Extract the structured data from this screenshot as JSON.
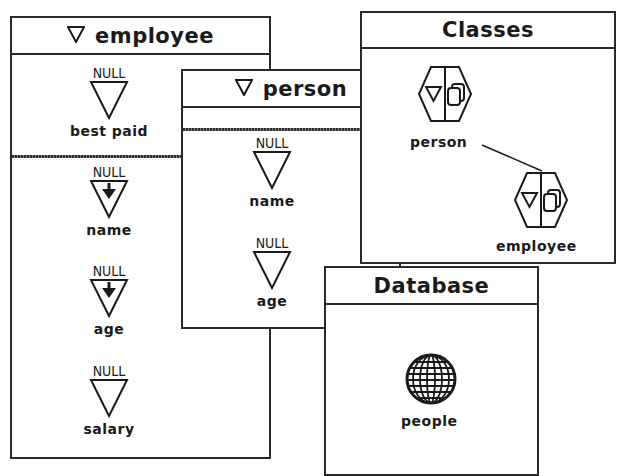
{
  "windows": {
    "employee": {
      "title": "employee",
      "top_slots": [
        {
          "value": "NULL",
          "label": "best paid",
          "inherited": false
        }
      ],
      "slots": [
        {
          "value": "NULL",
          "label": "name",
          "inherited": true
        },
        {
          "value": "NULL",
          "label": "age",
          "inherited": true
        },
        {
          "value": "NULL",
          "label": "salary",
          "inherited": false
        }
      ]
    },
    "person": {
      "title": "person",
      "slots": [
        {
          "value": "NULL",
          "label": "name"
        },
        {
          "value": "NULL",
          "label": "age"
        }
      ]
    },
    "classes": {
      "title": "Classes",
      "items": [
        {
          "label": "person",
          "icon": "class-hexagon-icon"
        },
        {
          "label": "employee",
          "icon": "class-hexagon-icon"
        }
      ],
      "link": {
        "from": "person",
        "to": "employee"
      }
    },
    "database": {
      "title": "Database",
      "items": [
        {
          "label": "people",
          "icon": "globe-icon"
        }
      ]
    }
  },
  "colors": {
    "ink": "#1a1a1a",
    "background": "#ffffff"
  }
}
